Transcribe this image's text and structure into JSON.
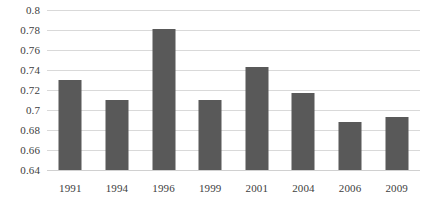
{
  "chart_data": {
    "type": "bar",
    "title": "",
    "subtitle": "",
    "xlabel": "",
    "ylabel": "",
    "categories": [
      "1991",
      "1994",
      "1996",
      "1999",
      "2001",
      "2004",
      "2006",
      "2009"
    ],
    "values": [
      0.73,
      0.71,
      0.781,
      0.71,
      0.743,
      0.717,
      0.688,
      0.693
    ],
    "series": [
      {
        "name": "",
        "values": [
          0.73,
          0.71,
          0.781,
          0.71,
          0.743,
          0.717,
          0.688,
          0.693
        ]
      }
    ],
    "ylim": [
      0.64,
      0.8
    ],
    "ytick_values": [
      0.8,
      0.78,
      0.76,
      0.74,
      0.72,
      0.7,
      0.68,
      0.66,
      0.64
    ],
    "ytick_labels": [
      "0.8",
      "0.78",
      "0.76",
      "0.74",
      "0.72",
      "0.7",
      "0.68",
      "0.66",
      "0.64"
    ],
    "grid": true,
    "grid_axis": "y",
    "legend": false,
    "legend_position": "none",
    "annotations": [],
    "colors": {
      "bar": "#595959",
      "gridline": "#d9d9d9",
      "baseline": "#d0d0d0",
      "text": "#404040",
      "background": "#ffffff"
    }
  }
}
